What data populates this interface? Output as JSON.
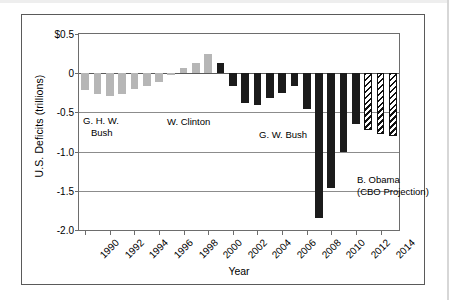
{
  "chart_data": {
    "type": "bar",
    "title": "",
    "xlabel": "Year",
    "ylabel": "U.S. Deficits (trillions)",
    "ylim": [
      -2.0,
      0.5
    ],
    "grid": true,
    "legend_position": "none",
    "ytick_labels": [
      "$0.5",
      "0",
      "-0.5",
      "-1.0",
      "-1.5",
      "-2.0"
    ],
    "ytick_values": [
      0.5,
      0,
      -0.5,
      -1.0,
      -1.5,
      -2.0
    ],
    "xtick_labels": [
      "1990",
      "1992",
      "1994",
      "1996",
      "1998",
      "2000",
      "2002",
      "2004",
      "2006",
      "2008",
      "2010",
      "2012",
      "2014"
    ],
    "categories": [
      "1990",
      "1991",
      "1992",
      "1993",
      "1994",
      "1995",
      "1996",
      "1997",
      "1998",
      "1999",
      "2000",
      "2001",
      "2002",
      "2003",
      "2004",
      "2005",
      "2006",
      "2007",
      "2008",
      "2009",
      "2010",
      "2011",
      "2012",
      "2013",
      "2014",
      "2015"
    ],
    "values": [
      -0.22,
      -0.27,
      -0.29,
      -0.26,
      -0.2,
      -0.16,
      -0.11,
      -0.02,
      0.06,
      0.13,
      0.24,
      0.13,
      -0.16,
      -0.38,
      -0.41,
      -0.32,
      -0.25,
      -0.16,
      -0.46,
      -1.85,
      -1.47,
      -1.0,
      -0.65,
      -0.72,
      -0.78,
      -0.8
    ],
    "bar_styles": [
      "light",
      "light",
      "light",
      "light",
      "light",
      "light",
      "light",
      "light",
      "light",
      "light",
      "light",
      "dark",
      "dark",
      "dark",
      "dark",
      "dark",
      "dark",
      "dark",
      "dark",
      "dark",
      "dark",
      "dark",
      "dark",
      "hatch",
      "hatch",
      "hatch"
    ],
    "series_style_legend": {
      "light": "G. H. W. Bush and W. Clinton years",
      "dark": "G. W. Bush and B. Obama actual",
      "hatch": "CBO Projection"
    },
    "annotations": [
      {
        "id": "ghwbush",
        "lines": [
          "G. H. W.",
          "Bush"
        ]
      },
      {
        "id": "clinton",
        "lines": [
          "W. Clinton"
        ]
      },
      {
        "id": "gwbush",
        "lines": [
          "G. W. Bush"
        ]
      },
      {
        "id": "obama",
        "lines": [
          "B. Obama",
          "(CBO Projection)"
        ]
      }
    ],
    "colors": {
      "light_bar": "#b6b6b6",
      "dark_bar": "#1b1b1b",
      "hatch_bar": "#111111",
      "axis": "#6d6d6d",
      "gridline": "#8c8c8c",
      "frame": "#5a5a5a",
      "background": "#ffffff"
    }
  },
  "annot": {
    "ghwbush_line1": "G. H. W.",
    "ghwbush_line2": "Bush",
    "clinton_line1": "W. Clinton",
    "gwbush_line1": "G. W. Bush",
    "obama_line1": "B. Obama",
    "obama_line2": "(CBO Projection)"
  },
  "axes": {
    "y_title": "U.S. Deficits (trillions)",
    "x_title": "Year"
  }
}
